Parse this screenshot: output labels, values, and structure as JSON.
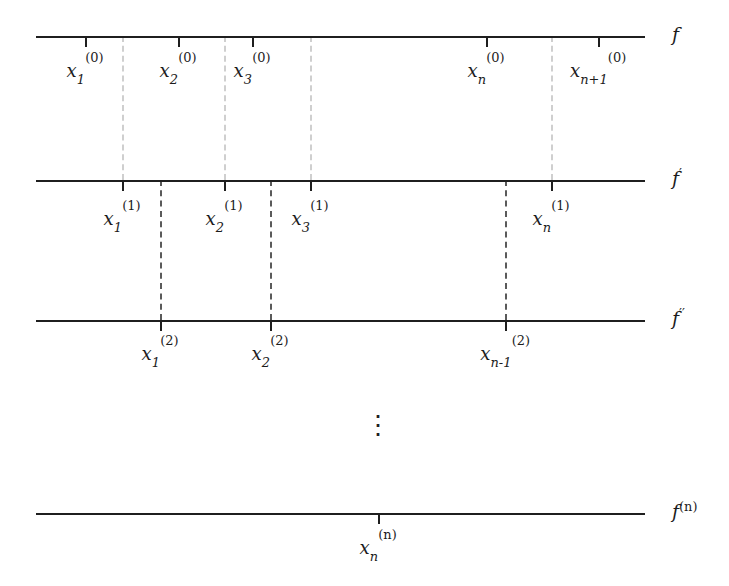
{
  "figure": {
    "type": "diagram",
    "background_color": "#ffffff",
    "line_color": "#1f1f1f",
    "light_dash_color": "#cfcfcf",
    "dark_dash_color": "#5a5a5a",
    "ellipsis": "⋮"
  },
  "rows": [
    {
      "id": "row-f",
      "label_base": "f",
      "label_sup": "",
      "line_y": 36,
      "line_x1": 36,
      "line_x2": 645,
      "label_x": 672,
      "label_y": 25,
      "points": [
        {
          "name": "x1-0",
          "x": 85,
          "base": "x",
          "sub": "1",
          "sup": "(0)",
          "label_y": 62
        },
        {
          "name": "x2-0",
          "x": 178,
          "base": "x",
          "sub": "2",
          "sup": "(0)",
          "label_y": 62
        },
        {
          "name": "x3-0",
          "x": 252,
          "base": "x",
          "sub": "3",
          "sup": "(0)",
          "label_y": 62
        },
        {
          "name": "xn-0",
          "x": 486,
          "base": "x",
          "sub": "n",
          "sup": "(0)",
          "label_y": 62
        },
        {
          "name": "xn1-0",
          "x": 598,
          "base": "x",
          "sub": "n+1",
          "sup": "(0)",
          "label_y": 62
        }
      ]
    },
    {
      "id": "row-f-prime",
      "label_base": "f",
      "label_sup": "′",
      "line_y": 180,
      "line_x1": 36,
      "line_x2": 645,
      "label_x": 672,
      "label_y": 169,
      "points": [
        {
          "name": "x1-1",
          "x": 122,
          "base": "x",
          "sub": "1",
          "sup": "(1)",
          "label_y": 210
        },
        {
          "name": "x2-1",
          "x": 224,
          "base": "x",
          "sub": "2",
          "sup": "(1)",
          "label_y": 210
        },
        {
          "name": "x3-1",
          "x": 310,
          "base": "x",
          "sub": "3",
          "sup": "(1)",
          "label_y": 210
        },
        {
          "name": "xn-1",
          "x": 551,
          "base": "x",
          "sub": "n",
          "sup": "(1)",
          "label_y": 210
        }
      ]
    },
    {
      "id": "row-f-double-prime",
      "label_base": "f",
      "label_sup": "′′",
      "line_y": 320,
      "line_x1": 36,
      "line_x2": 645,
      "label_x": 672,
      "label_y": 309,
      "points": [
        {
          "name": "x1-2",
          "x": 160,
          "base": "x",
          "sub": "1",
          "sup": "(2)",
          "label_y": 345
        },
        {
          "name": "x2-2",
          "x": 270,
          "base": "x",
          "sub": "2",
          "sup": "(2)",
          "label_y": 345
        },
        {
          "name": "xn1-2",
          "x": 505,
          "base": "x",
          "sub": "n-1",
          "sup": "(2)",
          "label_y": 345
        }
      ]
    },
    {
      "id": "row-f-n",
      "label_base": "f",
      "label_sup": "(n)",
      "line_y": 513,
      "line_x1": 36,
      "line_x2": 645,
      "label_x": 672,
      "label_y": 502,
      "points": [
        {
          "name": "xn-n",
          "x": 378,
          "base": "x",
          "sub": "n",
          "sup": "(n)",
          "label_y": 539
        }
      ]
    }
  ],
  "light_dashes": [
    {
      "name": "dash-x1-0",
      "x": 122,
      "y1": 36,
      "y2": 180
    },
    {
      "name": "dash-x2-0",
      "x": 224,
      "y1": 36,
      "y2": 180
    },
    {
      "name": "dash-x3-0",
      "x": 310,
      "y1": 36,
      "y2": 180
    },
    {
      "name": "dash-xn-0",
      "x": 551,
      "y1": 36,
      "y2": 180
    }
  ],
  "dark_dashes": [
    {
      "name": "dash-x1-1",
      "x": 160,
      "y1": 180,
      "y2": 320
    },
    {
      "name": "dash-x2-1",
      "x": 270,
      "y1": 180,
      "y2": 320
    },
    {
      "name": "dash-xn-1",
      "x": 505,
      "y1": 180,
      "y2": 320
    }
  ],
  "vertical_dots": {
    "name": "vertical-ellipsis",
    "x": 378,
    "y": 412,
    "glyph": "⋮"
  }
}
